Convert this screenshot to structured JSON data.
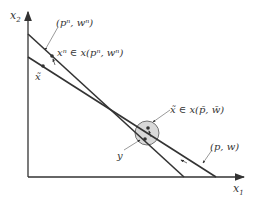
{
  "axes": {
    "x_label": "x",
    "x_sub": "1",
    "y_label": "x",
    "y_sub": "2"
  },
  "labels": {
    "pn_wn": "(pⁿ, wⁿ)",
    "xn_in": "xⁿ ∈ x(pⁿ, wⁿ)",
    "x_tilde": "x̃",
    "x_tilde_in": "x̃ ∈ x(p̄, w̄)",
    "p_w": "(p, w)",
    "y": "y"
  },
  "colors": {
    "line": "#333333",
    "circle_fill": "#d9d9d9"
  }
}
